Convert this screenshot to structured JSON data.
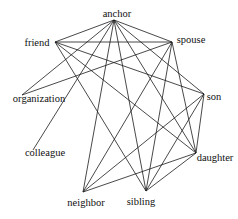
{
  "diagram": {
    "type": "network-graph",
    "nodes": [
      {
        "id": "anchor",
        "label": "anchor"
      },
      {
        "id": "friend",
        "label": "friend"
      },
      {
        "id": "spouse",
        "label": "spouse"
      },
      {
        "id": "organization",
        "label": "organization"
      },
      {
        "id": "son",
        "label": "son"
      },
      {
        "id": "colleague",
        "label": "colleague"
      },
      {
        "id": "daughter",
        "label": "daughter"
      },
      {
        "id": "neighbor",
        "label": "neighbor"
      },
      {
        "id": "sibling",
        "label": "sibling"
      }
    ],
    "edges": [
      [
        "anchor",
        "friend"
      ],
      [
        "anchor",
        "spouse"
      ],
      [
        "anchor",
        "organization"
      ],
      [
        "anchor",
        "colleague"
      ],
      [
        "anchor",
        "neighbor"
      ],
      [
        "anchor",
        "sibling"
      ],
      [
        "anchor",
        "son"
      ],
      [
        "anchor",
        "daughter"
      ],
      [
        "friend",
        "spouse"
      ],
      [
        "friend",
        "son"
      ],
      [
        "friend",
        "daughter"
      ],
      [
        "friend",
        "sibling"
      ],
      [
        "spouse",
        "organization"
      ],
      [
        "spouse",
        "neighbor"
      ],
      [
        "spouse",
        "sibling"
      ],
      [
        "spouse",
        "daughter"
      ],
      [
        "son",
        "neighbor"
      ],
      [
        "son",
        "sibling"
      ],
      [
        "son",
        "daughter"
      ],
      [
        "daughter",
        "neighbor"
      ],
      [
        "daughter",
        "sibling"
      ]
    ]
  }
}
